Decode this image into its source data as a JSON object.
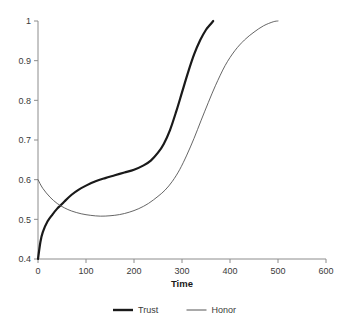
{
  "chart_data": {
    "type": "line",
    "title": "",
    "xlabel": "Time",
    "ylabel": "",
    "xlim": [
      0,
      600
    ],
    "ylim": [
      0.4,
      1.0
    ],
    "grid": false,
    "legend_position": "bottom",
    "xticks": [
      0,
      100,
      200,
      300,
      400,
      500,
      600
    ],
    "xtick_labels": [
      "0",
      "100",
      "200",
      "300",
      "400",
      "500",
      "600"
    ],
    "yticks": [
      0.4,
      0.5,
      0.6,
      0.7,
      0.8,
      0.9,
      1.0
    ],
    "ytick_labels": [
      "0.4",
      "0.5",
      "0.6",
      "0.7",
      "0.8",
      "0.9",
      "1"
    ],
    "series": [
      {
        "name": "Trust",
        "color": "#1a1a1a",
        "line_width": 2.2,
        "x": [
          0,
          5,
          10,
          20,
          30,
          40,
          47,
          55,
          70,
          85,
          100,
          120,
          140,
          160,
          180,
          200,
          220,
          235,
          250,
          262,
          275,
          288,
          300,
          312,
          325,
          338,
          350,
          358,
          365
        ],
        "values": [
          0.4,
          0.443,
          0.468,
          0.495,
          0.512,
          0.527,
          0.535,
          0.545,
          0.562,
          0.575,
          0.585,
          0.596,
          0.604,
          0.611,
          0.618,
          0.625,
          0.636,
          0.648,
          0.668,
          0.69,
          0.725,
          0.772,
          0.82,
          0.868,
          0.915,
          0.952,
          0.978,
          0.99,
          1.0
        ]
      },
      {
        "name": "Honor",
        "color": "#555555",
        "line_width": 0.9,
        "x": [
          0,
          10,
          25,
          40,
          55,
          70,
          90,
          110,
          130,
          150,
          170,
          190,
          210,
          230,
          250,
          265,
          280,
          295,
          310,
          325,
          340,
          355,
          370,
          390,
          410,
          430,
          450,
          470,
          490,
          500
        ],
        "values": [
          0.6,
          0.578,
          0.556,
          0.54,
          0.529,
          0.521,
          0.514,
          0.51,
          0.508,
          0.509,
          0.512,
          0.518,
          0.527,
          0.54,
          0.558,
          0.574,
          0.596,
          0.625,
          0.662,
          0.704,
          0.75,
          0.795,
          0.838,
          0.888,
          0.925,
          0.952,
          0.972,
          0.988,
          0.998,
          1.0
        ]
      }
    ],
    "annotations": []
  },
  "legend": {
    "items": [
      {
        "label": "Trust",
        "color": "#1a1a1a",
        "line_width": 2.4
      },
      {
        "label": "Honor",
        "color": "#555555",
        "line_width": 1.0
      }
    ]
  },
  "axes": {
    "x_title": "Time",
    "y_title": ""
  }
}
